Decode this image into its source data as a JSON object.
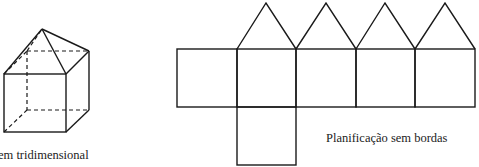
{
  "figure": {
    "solid": {
      "caption": "em tridimensional",
      "shape": "cube with square pyramid on top"
    },
    "net": {
      "caption": "Planificação sem bordas",
      "square_count": 6,
      "triangle_count": 4
    }
  },
  "colors": {
    "stroke": "#1a1a1a",
    "background": "#ffffff",
    "text": "#222222"
  }
}
